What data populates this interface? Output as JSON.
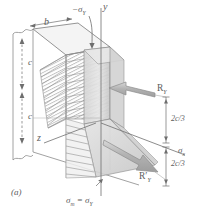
{
  "figure": {
    "caption": "(a)",
    "type": "isometric-stress-distribution-diagram"
  },
  "axes": {
    "y_label": "y",
    "z_label": "z",
    "sigma_x_label": "σ",
    "sigma_x_sub": "x"
  },
  "labels": {
    "minus_sigma_y": "−σ",
    "minus_sigma_y_sub": "Y",
    "sigma_m_equals": "σ",
    "sigma_m_sub": "m",
    "sigma_m_eq_sign": " = ",
    "sigma_y": "σ",
    "sigma_y_sub": "Y",
    "width_b": "b",
    "depth_c_upper": "c",
    "depth_c_lower": "c",
    "resultant_upper": "R",
    "resultant_upper_sub": "Y",
    "resultant_lower": "R′",
    "resultant_lower_sub": "Y",
    "lever_arm_upper": "2c/3",
    "lever_arm_lower": "2c/3"
  },
  "colors": {
    "line": "#6e6e6e",
    "line_light": "#9a9a9a",
    "hatch": "#8a8a8a",
    "face_gray": "#cfcfcf",
    "face_gray_light": "#e2e2e2",
    "arrow_gray": "#b9b9b9",
    "arrow_outline": "#8d8d8d",
    "text": "#5d5d5d"
  }
}
